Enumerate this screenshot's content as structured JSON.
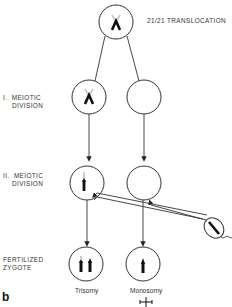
{
  "diagram": {
    "title": "21/21 TRANSLOCATION",
    "panel_letter": "b",
    "stages": [
      {
        "label_line1": "I.  MEIOTIC",
        "label_line2": "DIVISION"
      },
      {
        "label_line1": "II.  MEIOTIC",
        "label_line2": "DIVISION"
      },
      {
        "label_line1": "FERTILIZED",
        "label_line2": "ZYGOTE"
      }
    ],
    "outcomes": [
      {
        "label": "Trisomy"
      },
      {
        "label": "Monosomy",
        "symbol": "lethal-cross"
      }
    ],
    "colors": {
      "stroke": "#333333",
      "chromosome": "#111111",
      "faded": "#bbbbbb"
    }
  }
}
